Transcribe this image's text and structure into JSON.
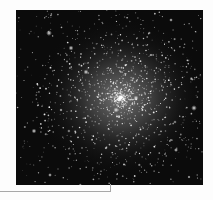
{
  "image": {
    "subject": "globular star cluster",
    "background_color": "#0b0b0b",
    "star_color": "#ffffff",
    "core_center": {
      "x": 0.56,
      "y": 0.5
    }
  },
  "callout": {
    "line_color": "#a8a8a8"
  }
}
